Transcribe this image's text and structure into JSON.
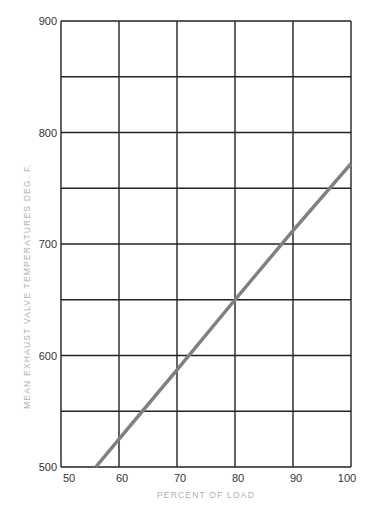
{
  "chart_data": {
    "type": "line",
    "title": "",
    "xlabel": "PERCENT OF LOAD",
    "ylabel": "MEAN EXHAUST VALVE TEMPERATURES DEG. F.",
    "xlim": [
      50,
      100
    ],
    "ylim": [
      500,
      900
    ],
    "x_ticks": [
      50,
      60,
      70,
      80,
      90,
      100
    ],
    "y_ticks": [
      500,
      600,
      700,
      800,
      900
    ],
    "x_ticks_labels": [
      "50",
      "60",
      "70",
      "80",
      "90",
      "100"
    ],
    "y_ticks_labels": [
      "500",
      "600",
      "700",
      "800",
      "900"
    ],
    "grid": {
      "vertical_every": 10,
      "horizontal_every": 50,
      "on": true
    },
    "legend": null,
    "series": [
      {
        "name": "Mean exhaust valve temperature",
        "color": "#808080",
        "x": [
          56,
          60,
          70,
          80,
          90,
          100
        ],
        "y": [
          500,
          525,
          587,
          650,
          712,
          772
        ]
      }
    ]
  },
  "colors": {
    "grid": "#222222",
    "line": "#808080",
    "axis_label": "#b0b0b0",
    "tick_label": "#333333"
  }
}
